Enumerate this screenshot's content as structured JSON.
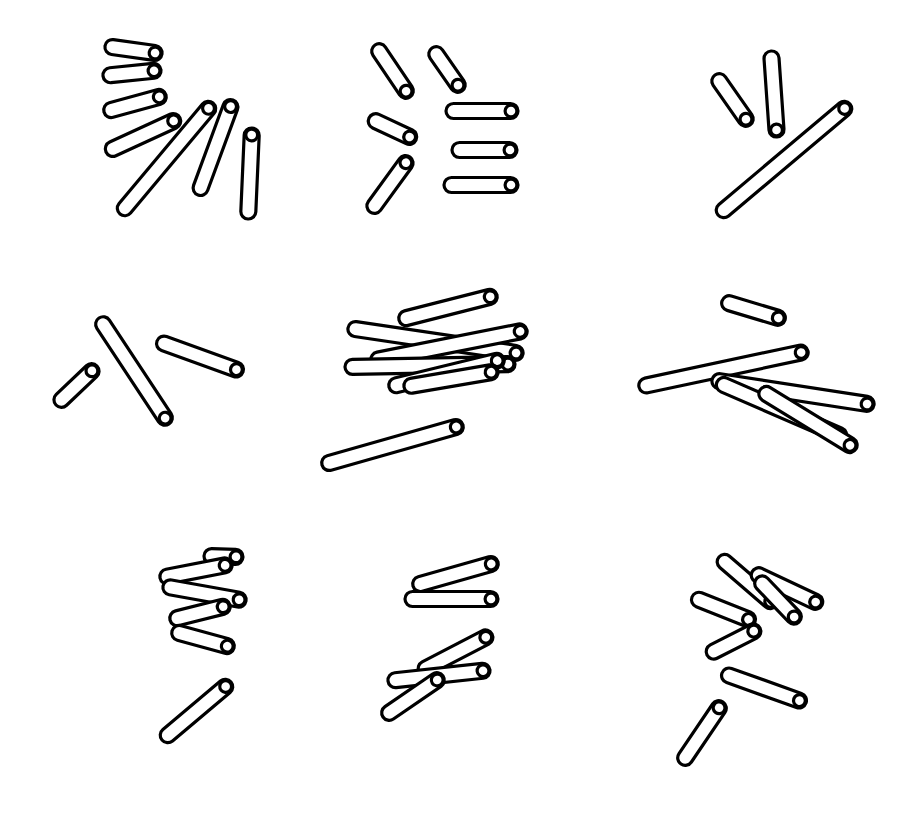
{
  "figure": {
    "title": "",
    "background_color": "#ffffff",
    "stick_fill_color": "#ffffff",
    "stick_stroke_color": "#000000",
    "stick_stroke_width": 3.2,
    "stick_thickness": 15,
    "canvas_width": 898,
    "canvas_height": 823,
    "grid_rows": 3,
    "grid_cols": 3,
    "panel_count": 9
  },
  "panels": [
    {
      "id": "panel-1",
      "name": "top-left",
      "row": 1,
      "col": 1,
      "stick_count": 7,
      "sticks": [
        {
          "x1": 105,
          "y1": 46,
          "x2": 162,
          "y2": 54,
          "length": 58,
          "angle_deg": 8
        },
        {
          "x1": 103,
          "y1": 76,
          "x2": 161,
          "y2": 70,
          "length": 58,
          "angle_deg": -6
        },
        {
          "x1": 104,
          "y1": 112,
          "x2": 166,
          "y2": 95,
          "length": 64,
          "angle_deg": -15
        },
        {
          "x1": 106,
          "y1": 152,
          "x2": 180,
          "y2": 118,
          "length": 81,
          "angle_deg": -25
        },
        {
          "x1": 120,
          "y1": 214,
          "x2": 213,
          "y2": 103,
          "length": 145,
          "angle_deg": -50
        },
        {
          "x1": 198,
          "y1": 195,
          "x2": 233,
          "y2": 100,
          "length": 101,
          "angle_deg": -70
        },
        {
          "x1": 248,
          "y1": 219,
          "x2": 252,
          "y2": 128,
          "length": 91,
          "angle_deg": -88
        }
      ]
    },
    {
      "id": "panel-2",
      "name": "top-center",
      "row": 1,
      "col": 2,
      "stick_count": 7,
      "sticks": [
        {
          "x1": 375,
          "y1": 45,
          "x2": 410,
          "y2": 97,
          "length": 63,
          "angle_deg": 56
        },
        {
          "x1": 432,
          "y1": 48,
          "x2": 462,
          "y2": 91,
          "length": 52,
          "angle_deg": 55
        },
        {
          "x1": 369,
          "y1": 118,
          "x2": 416,
          "y2": 140,
          "length": 52,
          "angle_deg": 25
        },
        {
          "x1": 446,
          "y1": 111,
          "x2": 518,
          "y2": 111,
          "length": 72,
          "angle_deg": 0
        },
        {
          "x1": 452,
          "y1": 150,
          "x2": 517,
          "y2": 150,
          "length": 65,
          "angle_deg": 0
        },
        {
          "x1": 444,
          "y1": 185,
          "x2": 518,
          "y2": 185,
          "length": 74,
          "angle_deg": 0
        },
        {
          "x1": 370,
          "y1": 212,
          "x2": 410,
          "y2": 157,
          "length": 68,
          "angle_deg": -54
        }
      ]
    },
    {
      "id": "panel-3",
      "name": "top-right",
      "row": 1,
      "col": 3,
      "stick_count": 3,
      "sticks": [
        {
          "x1": 715,
          "y1": 75,
          "x2": 750,
          "y2": 125,
          "length": 61,
          "angle_deg": 55
        },
        {
          "x1": 771,
          "y1": 51,
          "x2": 777,
          "y2": 137,
          "length": 86,
          "angle_deg": 86
        },
        {
          "x1": 718,
          "y1": 215,
          "x2": 850,
          "y2": 104,
          "length": 172,
          "angle_deg": -40
        }
      ]
    },
    {
      "id": "panel-4",
      "name": "middle-left",
      "row": 2,
      "col": 1,
      "stick_count": 3,
      "sticks": [
        {
          "x1": 99,
          "y1": 318,
          "x2": 169,
          "y2": 424,
          "length": 127,
          "angle_deg": 57
        },
        {
          "x1": 56,
          "y1": 405,
          "x2": 97,
          "y2": 366,
          "length": 57,
          "angle_deg": -44
        },
        {
          "x1": 157,
          "y1": 341,
          "x2": 243,
          "y2": 372,
          "length": 91,
          "angle_deg": 20
        }
      ]
    },
    {
      "id": "panel-5",
      "name": "middle-center",
      "row": 2,
      "col": 2,
      "stick_count": 7,
      "sticks": [
        {
          "x1": 399,
          "y1": 320,
          "x2": 497,
          "y2": 295,
          "length": 101,
          "angle_deg": -14
        },
        {
          "x1": 348,
          "y1": 328,
          "x2": 523,
          "y2": 354,
          "length": 177,
          "angle_deg": 8
        },
        {
          "x1": 371,
          "y1": 361,
          "x2": 527,
          "y2": 330,
          "length": 159,
          "angle_deg": -11
        },
        {
          "x1": 345,
          "y1": 367,
          "x2": 515,
          "y2": 364,
          "length": 170,
          "angle_deg": -1
        },
        {
          "x1": 389,
          "y1": 387,
          "x2": 504,
          "y2": 359,
          "length": 118,
          "angle_deg": -14
        },
        {
          "x1": 404,
          "y1": 387,
          "x2": 498,
          "y2": 371,
          "length": 95,
          "angle_deg": -10
        },
        {
          "x1": 322,
          "y1": 465,
          "x2": 463,
          "y2": 425,
          "length": 147,
          "angle_deg": -16
        }
      ]
    },
    {
      "id": "panel-6",
      "name": "middle-right",
      "row": 2,
      "col": 3,
      "stick_count": 5,
      "sticks": [
        {
          "x1": 722,
          "y1": 301,
          "x2": 785,
          "y2": 320,
          "length": 66,
          "angle_deg": 17
        },
        {
          "x1": 639,
          "y1": 387,
          "x2": 808,
          "y2": 351,
          "length": 173,
          "angle_deg": -12
        },
        {
          "x1": 712,
          "y1": 380,
          "x2": 874,
          "y2": 405,
          "length": 164,
          "angle_deg": 9
        },
        {
          "x1": 717,
          "y1": 382,
          "x2": 846,
          "y2": 438,
          "length": 141,
          "angle_deg": 23
        },
        {
          "x1": 760,
          "y1": 390,
          "x2": 856,
          "y2": 449,
          "length": 113,
          "angle_deg": 31
        }
      ]
    },
    {
      "id": "panel-7",
      "name": "bottom-left",
      "row": 3,
      "col": 1,
      "stick_count": 6,
      "sticks": [
        {
          "x1": 204,
          "y1": 556,
          "x2": 243,
          "y2": 557,
          "length": 39,
          "angle_deg": 1
        },
        {
          "x1": 160,
          "y1": 578,
          "x2": 232,
          "y2": 564,
          "length": 73,
          "angle_deg": -11
        },
        {
          "x1": 163,
          "y1": 586,
          "x2": 246,
          "y2": 601,
          "length": 84,
          "angle_deg": 10
        },
        {
          "x1": 170,
          "y1": 620,
          "x2": 230,
          "y2": 605,
          "length": 62,
          "angle_deg": -14
        },
        {
          "x1": 172,
          "y1": 631,
          "x2": 234,
          "y2": 648,
          "length": 64,
          "angle_deg": 15
        },
        {
          "x1": 162,
          "y1": 740,
          "x2": 231,
          "y2": 682,
          "length": 90,
          "angle_deg": -40
        }
      ]
    },
    {
      "id": "panel-8",
      "name": "bottom-center",
      "row": 3,
      "col": 2,
      "stick_count": 5,
      "sticks": [
        {
          "x1": 413,
          "y1": 586,
          "x2": 498,
          "y2": 562,
          "length": 88,
          "angle_deg": -16
        },
        {
          "x1": 405,
          "y1": 599,
          "x2": 498,
          "y2": 599,
          "length": 93,
          "angle_deg": 0
        },
        {
          "x1": 419,
          "y1": 672,
          "x2": 492,
          "y2": 634,
          "length": 82,
          "angle_deg": -27
        },
        {
          "x1": 388,
          "y1": 681,
          "x2": 490,
          "y2": 670,
          "length": 103,
          "angle_deg": -6
        },
        {
          "x1": 383,
          "y1": 717,
          "x2": 443,
          "y2": 676,
          "length": 73,
          "angle_deg": -34
        }
      ]
    },
    {
      "id": "panel-9",
      "name": "bottom-right",
      "row": 3,
      "col": 3,
      "stick_count": 7,
      "sticks": [
        {
          "x1": 719,
          "y1": 557,
          "x2": 776,
          "y2": 606,
          "length": 75,
          "angle_deg": 41
        },
        {
          "x1": 752,
          "y1": 572,
          "x2": 822,
          "y2": 605,
          "length": 77,
          "angle_deg": 25
        },
        {
          "x1": 757,
          "y1": 578,
          "x2": 799,
          "y2": 622,
          "length": 61,
          "angle_deg": 46
        },
        {
          "x1": 692,
          "y1": 597,
          "x2": 755,
          "y2": 622,
          "length": 68,
          "angle_deg": 22
        },
        {
          "x1": 707,
          "y1": 655,
          "x2": 760,
          "y2": 628,
          "length": 59,
          "angle_deg": -27
        },
        {
          "x1": 722,
          "y1": 673,
          "x2": 806,
          "y2": 703,
          "length": 89,
          "angle_deg": 20
        },
        {
          "x1": 681,
          "y1": 764,
          "x2": 723,
          "y2": 702,
          "length": 75,
          "angle_deg": -56
        }
      ]
    }
  ]
}
